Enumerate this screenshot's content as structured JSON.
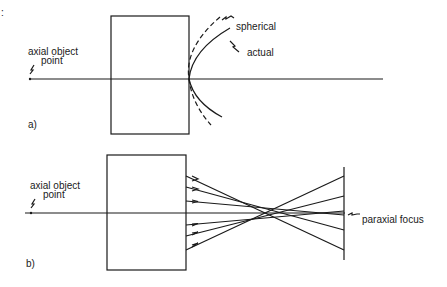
{
  "top_mark": ":",
  "panel_a": {
    "tag": "a)",
    "object_label_line1": "axial object",
    "object_label_line2": "point",
    "curve_labels": {
      "spherical": "spherical",
      "actual": "actual"
    }
  },
  "panel_b": {
    "tag": "b)",
    "object_label_line1": "axial object",
    "object_label_line2": "point",
    "focus_label": "paraxial focus"
  },
  "colors": {
    "ink": "#1a1a1a",
    "background": "#ffffff"
  }
}
